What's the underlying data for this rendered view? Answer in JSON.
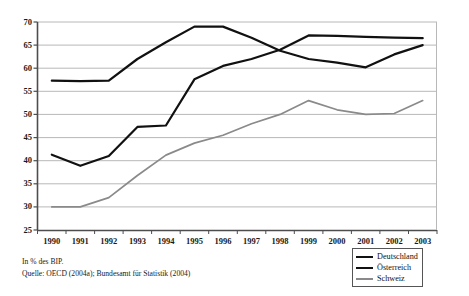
{
  "chart_data": {
    "type": "line",
    "title": "",
    "subtitle": "",
    "xlabel": "",
    "ylabel": "",
    "categories": [
      "1990",
      "1991",
      "1992",
      "1993",
      "1994",
      "1995",
      "1996",
      "1997",
      "1998",
      "1999",
      "2000",
      "2001",
      "2002",
      "2003"
    ],
    "ylim": [
      25,
      70
    ],
    "ytick_step": 5,
    "yticks": [
      "70",
      "65",
      "60",
      "55",
      "50",
      "45",
      "40",
      "35",
      "30",
      "25"
    ],
    "grid": "horizontal",
    "legend_position": "bottom-right",
    "series": [
      {
        "name": "Deutschland",
        "color": "#111111",
        "width": 2.2,
        "values": [
          57.3,
          57.2,
          57.3,
          62.0,
          65.6,
          69.0,
          69.0,
          66.6,
          63.8,
          62.0,
          61.2,
          60.2,
          63.0,
          65.0
        ]
      },
      {
        "name": "Österreich",
        "color": "#111111",
        "width": 2.2,
        "values": [
          41.3,
          38.9,
          41.0,
          47.3,
          47.6,
          57.6,
          60.5,
          62.0,
          64.0,
          67.1,
          67.0,
          66.8,
          66.6,
          66.5
        ]
      },
      {
        "name": "Schweiz",
        "color": "#8a8a8a",
        "width": 1.7,
        "values": [
          30.0,
          30.0,
          32.0,
          36.8,
          41.2,
          43.8,
          45.5,
          48.0,
          50.0,
          53.0,
          51.0,
          50.0,
          50.2,
          53.0
        ]
      }
    ],
    "annotations": {
      "unit_note": "In % des BIP.",
      "source_note": "Quelle: OECD (2004a); Bundesamt für Statistik (2004)"
    }
  },
  "legend": {
    "items": [
      {
        "label": "Deutschland"
      },
      {
        "label": "Österreich"
      },
      {
        "label": "Schweiz"
      }
    ]
  },
  "colors": {
    "axis": "#4d4d4d",
    "grid": "#b8b8b8",
    "deutschland": "#111111",
    "oesterreich": "#111111",
    "schweiz": "#8a8a8a",
    "text": "#1a1a1a"
  }
}
